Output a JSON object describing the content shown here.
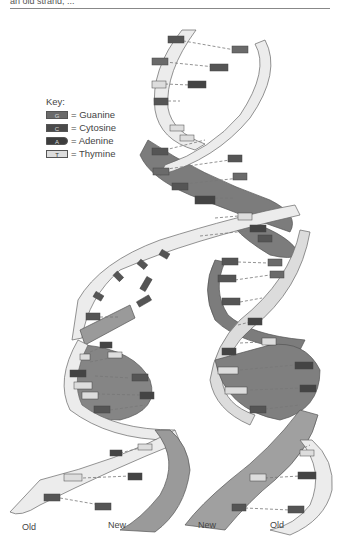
{
  "caption": "an old strand, ...",
  "key": {
    "title": "Key:",
    "items": [
      {
        "letter": "G",
        "name": "Guanine",
        "color": "#6a6a6a",
        "text": "= Guanine"
      },
      {
        "letter": "C",
        "name": "Cytosine",
        "color": "#4a4a4a",
        "text": "= Cytosine"
      },
      {
        "letter": "A",
        "name": "Adenine",
        "color": "#3d3d3d",
        "text": "= Adenine"
      },
      {
        "letter": "T",
        "name": "Thymine",
        "color": "#dcdcdc",
        "text": "= Thymine"
      }
    ]
  },
  "labels": {
    "bottom_left_old": "Old",
    "bottom_left_new": "New",
    "bottom_right_new": "New",
    "bottom_right_old": "Old"
  },
  "colors": {
    "old_strand": "#ececec",
    "new_strand": "#9a9a9a",
    "dark_band": "#7a7a7a",
    "outline": "#666666"
  },
  "parent_pairs": [
    {
      "left": "C",
      "right": "G"
    },
    {
      "left": "G",
      "right": "C"
    },
    {
      "left": "T",
      "right": "A"
    },
    {
      "left": "C",
      "right": "G"
    },
    {
      "left": "T",
      "right": "A"
    },
    {
      "left": "A",
      "right": "T"
    },
    {
      "left": "G",
      "right": "C"
    },
    {
      "left": "G",
      "right": "C"
    },
    {
      "left": "C",
      "right": "G"
    },
    {
      "left": "A",
      "right": "T"
    },
    {
      "left": "A",
      "right": "T"
    },
    {
      "left": "T",
      "right": "A"
    }
  ],
  "free_nucleotides": [
    "G",
    "A",
    "C",
    "C",
    "G",
    "G"
  ],
  "left_daughter_pairs": [
    {
      "left": "C",
      "right": "G"
    },
    {
      "left": "T",
      "right": "A"
    },
    {
      "left": "A",
      "right": "T"
    },
    {
      "left": "T",
      "right": "A"
    },
    {
      "left": "T",
      "right": "A"
    },
    {
      "left": "C",
      "right": "G"
    },
    {
      "left": "A",
      "right": "T"
    },
    {
      "left": "T",
      "right": "A"
    },
    {
      "left": "G",
      "right": "C"
    }
  ],
  "right_daughter_pairs": [
    {
      "left": "C",
      "right": "G"
    },
    {
      "left": "C",
      "right": "G"
    },
    {
      "left": "C",
      "right": "G"
    },
    {
      "left": "T",
      "right": "A"
    },
    {
      "left": "A",
      "right": "T"
    },
    {
      "left": "T",
      "right": "A"
    },
    {
      "left": "T",
      "right": "A"
    },
    {
      "left": "C",
      "right": "G"
    },
    {
      "left": "A",
      "right": "T"
    },
    {
      "left": "T",
      "right": "A"
    },
    {
      "left": "G",
      "right": "C"
    }
  ]
}
